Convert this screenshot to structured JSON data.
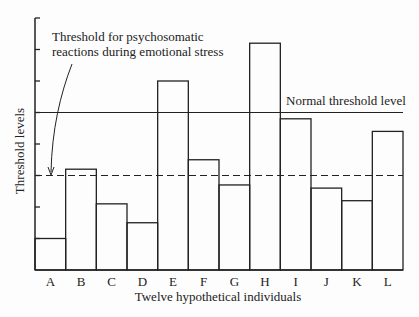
{
  "chart_data": {
    "type": "bar",
    "title": "",
    "xlabel": "Twelve hypothetical individuals",
    "ylabel": "Threshold levels",
    "categories": [
      "A",
      "B",
      "C",
      "D",
      "E",
      "F",
      "G",
      "H",
      "I",
      "J",
      "K",
      "L"
    ],
    "values": [
      1.0,
      3.2,
      2.1,
      1.5,
      6.0,
      3.5,
      2.7,
      7.2,
      4.8,
      2.6,
      2.2,
      4.4
    ],
    "ylim": [
      0,
      8
    ],
    "yticks": [
      0,
      1,
      2,
      3,
      4,
      5,
      6,
      7,
      8
    ],
    "ytick_labels_shown": false,
    "grid": false,
    "bar_style": "outline",
    "reference_lines": [
      {
        "name": "normal",
        "value": 5.0,
        "style": "solid",
        "label": "Normal threshold level"
      },
      {
        "name": "stress",
        "value": 3.0,
        "style": "dashed",
        "label": "Threshold for psychosomatic reactions during emotional stress"
      }
    ],
    "annotations": [
      {
        "text": "Threshold for psychosomatic",
        "line": 1
      },
      {
        "text": "reactions during emotional stress",
        "line": 2
      },
      {
        "text": "Normal threshold level",
        "target": "normal"
      }
    ]
  },
  "labels": {
    "ylabel": "Threshold levels",
    "xlabel": "Twelve hypothetical individuals",
    "normal": "Normal threshold level",
    "stress_line1": "Threshold for psychosomatic",
    "stress_line2": "reactions during emotional stress"
  },
  "colors": {
    "ink": "#222222",
    "background": "#fdfdfd"
  }
}
